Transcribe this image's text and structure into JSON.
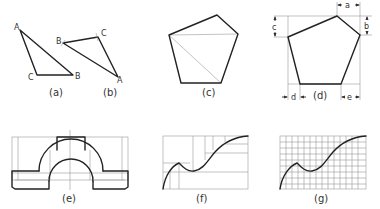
{
  "figures": {
    "a": {
      "caption": "(a)",
      "vertex_labels": {
        "A": "A",
        "B": "B",
        "C": "C"
      }
    },
    "b": {
      "caption": "(b)",
      "vertex_labels": {
        "A": "A",
        "B": "B",
        "C": "C"
      }
    },
    "c": {
      "caption": "(c)"
    },
    "d": {
      "caption": "(d)",
      "dimension_labels": {
        "a": "a",
        "b": "b",
        "c": "c",
        "d": "d",
        "e": "e"
      }
    },
    "e": {
      "caption": "(e)"
    },
    "f": {
      "caption": "(f)"
    },
    "g": {
      "caption": "(g)"
    }
  },
  "colors": {
    "line": "#222222",
    "construction": "#999999",
    "background": "#ffffff"
  }
}
